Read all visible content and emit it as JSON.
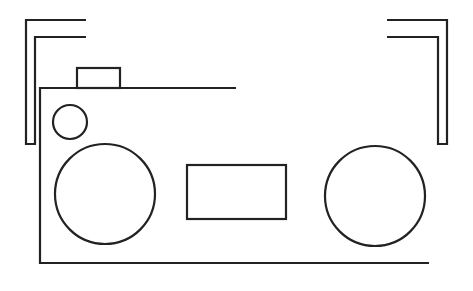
{
  "diagram": {
    "stroke_color": "#222222",
    "background": "#ffffff",
    "elements": [
      {
        "name": "left-bracket",
        "type": "bracket"
      },
      {
        "name": "right-bracket",
        "type": "bracket"
      },
      {
        "name": "body-outline",
        "type": "open-frame"
      },
      {
        "name": "handle-button",
        "type": "rect"
      },
      {
        "name": "small-knob",
        "type": "circle"
      },
      {
        "name": "left-speaker",
        "type": "circle"
      },
      {
        "name": "display-panel",
        "type": "rect"
      },
      {
        "name": "right-speaker",
        "type": "circle"
      }
    ]
  }
}
